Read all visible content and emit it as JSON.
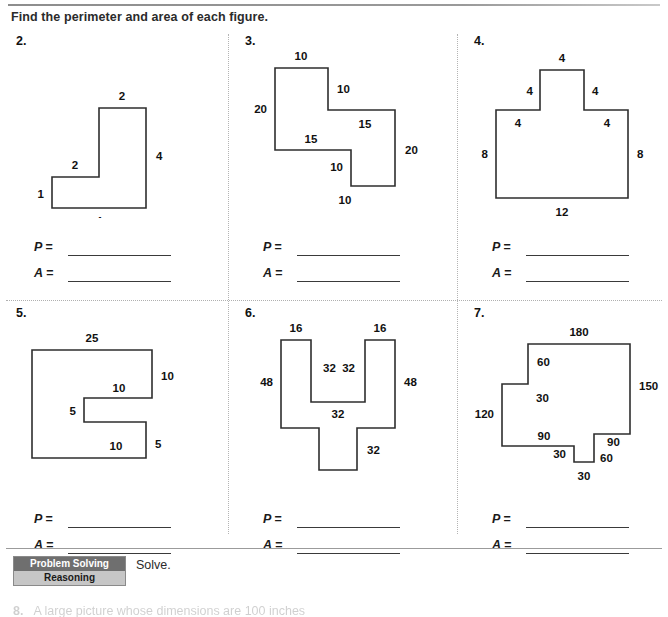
{
  "page": {
    "instruction": "Find the perimeter and area of each figure.",
    "answer_labels": {
      "perimeter": "P =",
      "area": "A ="
    }
  },
  "problems": [
    {
      "number": "2.",
      "shape": "L-shape",
      "viewbox": "0 0 222 180",
      "path": "M 48,170 L 48,139 L 95,139 L 95,70 L 142,70 L 142,170 Z",
      "labels": [
        {
          "text": "2",
          "x": 118,
          "y": 62,
          "anchor": "middle"
        },
        {
          "text": "4",
          "x": 152,
          "y": 122,
          "anchor": "start"
        },
        {
          "text": "2",
          "x": 71,
          "y": 131,
          "anchor": "middle"
        },
        {
          "text": "1",
          "x": 40,
          "y": 160,
          "anchor": "end"
        },
        {
          "text": "4",
          "x": 95,
          "y": 187,
          "anchor": "middle"
        }
      ]
    },
    {
      "number": "3.",
      "shape": "Z-shape",
      "viewbox": "0 0 222 180",
      "path": "M 42,30 L 95,30 L 95,72 L 162,72 L 162,148 L 118,148 L 118,112 L 42,112 Z",
      "labels": [
        {
          "text": "10",
          "x": 68,
          "y": 22,
          "anchor": "middle"
        },
        {
          "text": "10",
          "x": 104,
          "y": 55,
          "anchor": "start"
        },
        {
          "text": "15",
          "x": 132,
          "y": 90,
          "anchor": "middle"
        },
        {
          "text": "20",
          "x": 172,
          "y": 116,
          "anchor": "start"
        },
        {
          "text": "10",
          "x": 112,
          "y": 166,
          "anchor": "middle"
        },
        {
          "text": "10",
          "x": 110,
          "y": 133,
          "anchor": "end"
        },
        {
          "text": "15",
          "x": 78,
          "y": 105,
          "anchor": "middle"
        },
        {
          "text": "20",
          "x": 34,
          "y": 75,
          "anchor": "end"
        }
      ]
    },
    {
      "number": "4.",
      "shape": "T-shape",
      "viewbox": "0 0 222 180",
      "path": "M 34,160 L 34,72 L 78,72 L 78,32 L 122,32 L 122,72 L 166,72 L 166,160 Z",
      "labels": [
        {
          "text": "4",
          "x": 100,
          "y": 24,
          "anchor": "middle"
        },
        {
          "text": "4",
          "x": 71,
          "y": 57,
          "anchor": "end"
        },
        {
          "text": "4",
          "x": 130,
          "y": 57,
          "anchor": "start"
        },
        {
          "text": "4",
          "x": 56,
          "y": 89,
          "anchor": "middle"
        },
        {
          "text": "4",
          "x": 145,
          "y": 89,
          "anchor": "middle"
        },
        {
          "text": "8",
          "x": 26,
          "y": 120,
          "anchor": "end"
        },
        {
          "text": "8",
          "x": 175,
          "y": 120,
          "anchor": "start"
        },
        {
          "text": "12",
          "x": 100,
          "y": 178,
          "anchor": "middle"
        }
      ]
    },
    {
      "number": "5.",
      "shape": "C-shape",
      "viewbox": "0 0 222 180",
      "path": "M 28,40 L 148,40 L 148,88 L 80,88 L 80,112 L 142,112 L 142,148 L 28,148 Z",
      "labels": [
        {
          "text": "25",
          "x": 88,
          "y": 32,
          "anchor": "middle"
        },
        {
          "text": "10",
          "x": 157,
          "y": 70,
          "anchor": "start"
        },
        {
          "text": "10",
          "x": 115,
          "y": 82,
          "anchor": "middle"
        },
        {
          "text": "5",
          "x": 72,
          "y": 105,
          "anchor": "end"
        },
        {
          "text": "10",
          "x": 112,
          "y": 140,
          "anchor": "middle"
        },
        {
          "text": "5",
          "x": 151,
          "y": 138,
          "anchor": "start"
        }
      ]
    },
    {
      "number": "6.",
      "shape": "goblet-shape",
      "viewbox": "0 0 222 180",
      "path": "M 48,30 L 78,30 L 78,92 L 132,92 L 132,30 L 162,30 L 162,118 L 124,118 L 124,160 L 86,160 L 86,118 L 48,118 Z",
      "labels": [
        {
          "text": "16",
          "x": 63,
          "y": 22,
          "anchor": "middle"
        },
        {
          "text": "16",
          "x": 147,
          "y": 22,
          "anchor": "middle"
        },
        {
          "text": "32",
          "x": 90,
          "y": 62,
          "anchor": "start"
        },
        {
          "text": "32",
          "x": 122,
          "y": 62,
          "anchor": "end"
        },
        {
          "text": "48",
          "x": 40,
          "y": 76,
          "anchor": "end"
        },
        {
          "text": "48",
          "x": 171,
          "y": 76,
          "anchor": "start"
        },
        {
          "text": "32",
          "x": 105,
          "y": 108,
          "anchor": "middle"
        },
        {
          "text": "32",
          "x": 134,
          "y": 144,
          "anchor": "start"
        }
      ]
    },
    {
      "number": "7.",
      "shape": "complex-polygon",
      "viewbox": "0 0 222 180",
      "path": "M 40,74 L 66,74 L 66,34 L 168,34 L 168,124 L 132,124 L 132,152 L 112,152 L 112,136 L 40,136 Z",
      "labels": [
        {
          "text": "180",
          "x": 117,
          "y": 26,
          "anchor": "middle"
        },
        {
          "text": "60",
          "x": 75,
          "y": 56,
          "anchor": "start"
        },
        {
          "text": "150",
          "x": 177,
          "y": 80,
          "anchor": "start"
        },
        {
          "text": "30",
          "x": 74,
          "y": 92,
          "anchor": "start"
        },
        {
          "text": "120",
          "x": 32,
          "y": 108,
          "anchor": "end"
        },
        {
          "text": "90",
          "x": 82,
          "y": 130,
          "anchor": "middle"
        },
        {
          "text": "90",
          "x": 145,
          "y": 136,
          "anchor": "start"
        },
        {
          "text": "30",
          "x": 104,
          "y": 148,
          "anchor": "end"
        },
        {
          "text": "60",
          "x": 138,
          "y": 152,
          "anchor": "start"
        },
        {
          "text": "30",
          "x": 122,
          "y": 170,
          "anchor": "middle"
        }
      ]
    }
  ],
  "bottom": {
    "badge_line1": "Problem Solving",
    "badge_line2": "Reasoning",
    "solve_label": "Solve.",
    "last_item_number": "8.",
    "last_item_text": "A large picture whose dimensions are 100 inches"
  }
}
